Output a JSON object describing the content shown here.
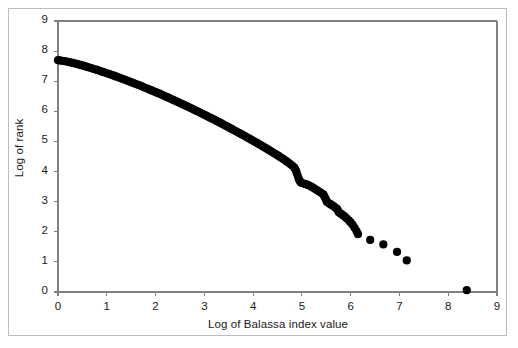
{
  "figure": {
    "background_color": "#ffffff",
    "border_color": "#bdbdbd",
    "marker_color": "#000000",
    "axis_color": "#808080"
  },
  "chart_data": {
    "type": "scatter",
    "title": "",
    "subtitle": "",
    "xlabel": "Log of Balassa index value",
    "ylabel": "Log of rank",
    "xlim": [
      0,
      9
    ],
    "ylim": [
      0,
      9
    ],
    "xticks": [
      0,
      1,
      2,
      3,
      4,
      5,
      6,
      7,
      8,
      9
    ],
    "yticks": [
      0,
      1,
      2,
      3,
      4,
      5,
      6,
      7,
      8,
      9
    ],
    "xtick_labels": [
      "0",
      "1",
      "2",
      "3",
      "4",
      "5",
      "6",
      "7",
      "8",
      "9"
    ],
    "ytick_labels": [
      "0",
      "1",
      "2",
      "3",
      "4",
      "5",
      "6",
      "7",
      "8",
      "9"
    ],
    "grid": false,
    "legend": null,
    "legend_position": "none",
    "marker_size": 5,
    "annotations": [],
    "series": [
      {
        "name": "Balassa index rank distribution",
        "description": "Dense Zipf-like rank-size curve of log rank versus log Balassa index value, with a thick continuous band from x=0 to x≈6.15 and isolated outlier points in the tail.",
        "points": [
          [
            0.0,
            7.7
          ],
          [
            0.04,
            7.69
          ],
          [
            0.08,
            7.68
          ],
          [
            0.12,
            7.67
          ],
          [
            0.16,
            7.66
          ],
          [
            0.2,
            7.645
          ],
          [
            0.24,
            7.63
          ],
          [
            0.28,
            7.615
          ],
          [
            0.32,
            7.6
          ],
          [
            0.36,
            7.585
          ],
          [
            0.4,
            7.565
          ],
          [
            0.44,
            7.55
          ],
          [
            0.48,
            7.53
          ],
          [
            0.52,
            7.515
          ],
          [
            0.56,
            7.495
          ],
          [
            0.6,
            7.475
          ],
          [
            0.64,
            7.455
          ],
          [
            0.68,
            7.435
          ],
          [
            0.72,
            7.415
          ],
          [
            0.76,
            7.395
          ],
          [
            0.8,
            7.375
          ],
          [
            0.84,
            7.355
          ],
          [
            0.88,
            7.33
          ],
          [
            0.92,
            7.31
          ],
          [
            0.96,
            7.29
          ],
          [
            1.0,
            7.265
          ],
          [
            1.04,
            7.245
          ],
          [
            1.08,
            7.22
          ],
          [
            1.12,
            7.2
          ],
          [
            1.16,
            7.175
          ],
          [
            1.2,
            7.15
          ],
          [
            1.24,
            7.13
          ],
          [
            1.28,
            7.105
          ],
          [
            1.32,
            7.08
          ],
          [
            1.36,
            7.055
          ],
          [
            1.4,
            7.03
          ],
          [
            1.44,
            7.005
          ],
          [
            1.48,
            6.98
          ],
          [
            1.52,
            6.955
          ],
          [
            1.56,
            6.93
          ],
          [
            1.6,
            6.905
          ],
          [
            1.64,
            6.88
          ],
          [
            1.68,
            6.855
          ],
          [
            1.72,
            6.83
          ],
          [
            1.76,
            6.8
          ],
          [
            1.8,
            6.775
          ],
          [
            1.84,
            6.75
          ],
          [
            1.88,
            6.72
          ],
          [
            1.92,
            6.695
          ],
          [
            1.96,
            6.665
          ],
          [
            2.0,
            6.64
          ],
          [
            2.04,
            6.61
          ],
          [
            2.08,
            6.585
          ],
          [
            2.12,
            6.555
          ],
          [
            2.16,
            6.525
          ],
          [
            2.2,
            6.5
          ],
          [
            2.24,
            6.47
          ],
          [
            2.28,
            6.44
          ],
          [
            2.32,
            6.41
          ],
          [
            2.36,
            6.38
          ],
          [
            2.4,
            6.35
          ],
          [
            2.44,
            6.32
          ],
          [
            2.48,
            6.29
          ],
          [
            2.52,
            6.26
          ],
          [
            2.56,
            6.23
          ],
          [
            2.6,
            6.2
          ],
          [
            2.64,
            6.17
          ],
          [
            2.68,
            6.14
          ],
          [
            2.72,
            6.11
          ],
          [
            2.76,
            6.08
          ],
          [
            2.8,
            6.045
          ],
          [
            2.84,
            6.015
          ],
          [
            2.88,
            5.985
          ],
          [
            2.92,
            5.95
          ],
          [
            2.96,
            5.92
          ],
          [
            3.0,
            5.885
          ],
          [
            3.04,
            5.855
          ],
          [
            3.08,
            5.82
          ],
          [
            3.12,
            5.79
          ],
          [
            3.16,
            5.755
          ],
          [
            3.2,
            5.725
          ],
          [
            3.24,
            5.69
          ],
          [
            3.28,
            5.655
          ],
          [
            3.32,
            5.625
          ],
          [
            3.36,
            5.59
          ],
          [
            3.4,
            5.555
          ],
          [
            3.44,
            5.52
          ],
          [
            3.48,
            5.485
          ],
          [
            3.52,
            5.45
          ],
          [
            3.56,
            5.415
          ],
          [
            3.6,
            5.38
          ],
          [
            3.64,
            5.345
          ],
          [
            3.68,
            5.31
          ],
          [
            3.72,
            5.275
          ],
          [
            3.76,
            5.24
          ],
          [
            3.8,
            5.205
          ],
          [
            3.84,
            5.17
          ],
          [
            3.88,
            5.13
          ],
          [
            3.92,
            5.095
          ],
          [
            3.96,
            5.06
          ],
          [
            4.0,
            5.02
          ],
          [
            4.04,
            4.985
          ],
          [
            4.08,
            4.95
          ],
          [
            4.12,
            4.91
          ],
          [
            4.16,
            4.875
          ],
          [
            4.2,
            4.835
          ],
          [
            4.24,
            4.795
          ],
          [
            4.28,
            4.76
          ],
          [
            4.32,
            4.72
          ],
          [
            4.36,
            4.68
          ],
          [
            4.4,
            4.64
          ],
          [
            4.44,
            4.6
          ],
          [
            4.48,
            4.56
          ],
          [
            4.52,
            4.52
          ],
          [
            4.56,
            4.475
          ],
          [
            4.6,
            4.435
          ],
          [
            4.64,
            4.39
          ],
          [
            4.68,
            4.345
          ],
          [
            4.72,
            4.3
          ],
          [
            4.76,
            4.25
          ],
          [
            4.8,
            4.2
          ],
          [
            4.84,
            4.14
          ],
          [
            4.86,
            4.09
          ],
          [
            4.88,
            4.02
          ],
          [
            4.9,
            3.93
          ],
          [
            4.92,
            3.83
          ],
          [
            4.94,
            3.74
          ],
          [
            4.96,
            3.68
          ],
          [
            4.98,
            3.64
          ],
          [
            5.0,
            3.62
          ],
          [
            5.04,
            3.6
          ],
          [
            5.08,
            3.58
          ],
          [
            5.12,
            3.555
          ],
          [
            5.16,
            3.525
          ],
          [
            5.2,
            3.49
          ],
          [
            5.24,
            3.45
          ],
          [
            5.28,
            3.41
          ],
          [
            5.32,
            3.37
          ],
          [
            5.36,
            3.33
          ],
          [
            5.4,
            3.285
          ],
          [
            5.44,
            3.24
          ],
          [
            5.46,
            3.18
          ],
          [
            5.48,
            3.11
          ],
          [
            5.5,
            3.04
          ],
          [
            5.52,
            2.98
          ],
          [
            5.56,
            2.94
          ],
          [
            5.6,
            2.9
          ],
          [
            5.64,
            2.86
          ],
          [
            5.68,
            2.81
          ],
          [
            5.72,
            2.76
          ],
          [
            5.74,
            2.7
          ],
          [
            5.76,
            2.64
          ],
          [
            5.8,
            2.6
          ],
          [
            5.84,
            2.55
          ],
          [
            5.88,
            2.5
          ],
          [
            5.92,
            2.44
          ],
          [
            5.96,
            2.38
          ],
          [
            6.0,
            2.31
          ],
          [
            6.04,
            2.23
          ],
          [
            6.08,
            2.13
          ],
          [
            6.12,
            2.02
          ],
          [
            6.15,
            1.92
          ],
          [
            6.4,
            1.73
          ],
          [
            6.67,
            1.58
          ],
          [
            6.95,
            1.33
          ],
          [
            7.15,
            1.05
          ],
          [
            8.38,
            0.06
          ]
        ]
      }
    ]
  }
}
